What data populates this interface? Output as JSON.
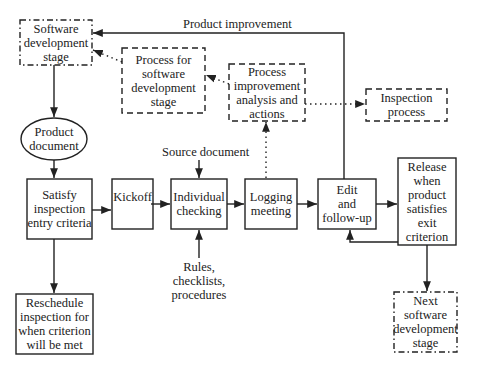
{
  "diagram": {
    "colors": {
      "line": "#222222",
      "background": "#ffffff"
    },
    "nodes": {
      "software_dev_stage": {
        "lines": [
          "Software",
          "development",
          "stage"
        ],
        "border": "dash-dot"
      },
      "process_for_sw_dev": {
        "lines": [
          "Process for",
          "software",
          "development",
          "stage"
        ],
        "border": "dashed"
      },
      "process_improvement": {
        "lines": [
          "Process",
          "improvement",
          "analysis and",
          "actions"
        ],
        "border": "dashed"
      },
      "inspection_process": {
        "lines": [
          "Inspection",
          "process"
        ],
        "border": "dashed"
      },
      "product_document": {
        "lines": [
          "Product",
          "document"
        ],
        "shape": "ellipse"
      },
      "satisfy_entry": {
        "lines": [
          "Satisfy",
          "inspection",
          "entry criteria"
        ],
        "border": "solid"
      },
      "kickoff": {
        "lines": [
          "Kickoff"
        ],
        "border": "solid"
      },
      "individual_checking": {
        "lines": [
          "Individual",
          "checking"
        ],
        "border": "solid"
      },
      "logging_meeting": {
        "lines": [
          "Logging",
          "meeting"
        ],
        "border": "solid"
      },
      "edit_followup": {
        "lines": [
          "Edit",
          "and",
          "follow-up"
        ],
        "border": "solid"
      },
      "release": {
        "lines": [
          "Release",
          "when",
          "product",
          "satisfies",
          "exit",
          "criterion"
        ],
        "border": "solid"
      },
      "reschedule": {
        "lines": [
          "Reschedule",
          "inspection for",
          "when criterion",
          "will be met"
        ],
        "border": "solid"
      },
      "next_sw_dev_stage": {
        "lines": [
          "Next",
          "software",
          "development",
          "stage"
        ],
        "border": "dash-dot"
      }
    },
    "labels": {
      "product_improvement": "Product improvement",
      "source_document": "Source document",
      "rules": [
        "Rules,",
        "checklists,",
        "procedures"
      ]
    },
    "edges": [
      {
        "from": "software_dev_stage",
        "to": "product_document",
        "style": "solid"
      },
      {
        "from": "product_document",
        "to": "satisfy_entry",
        "style": "solid"
      },
      {
        "from": "satisfy_entry",
        "to": "kickoff",
        "style": "solid"
      },
      {
        "from": "satisfy_entry",
        "to": "reschedule",
        "style": "solid"
      },
      {
        "from": "kickoff",
        "to": "individual_checking",
        "style": "solid"
      },
      {
        "from": "individual_checking",
        "to": "logging_meeting",
        "style": "solid"
      },
      {
        "from": "logging_meeting",
        "to": "edit_followup",
        "style": "solid"
      },
      {
        "from": "edit_followup",
        "to": "release",
        "style": "solid"
      },
      {
        "from": "release",
        "to": "edit_followup",
        "style": "solid"
      },
      {
        "from": "release",
        "to": "next_sw_dev_stage",
        "style": "solid"
      },
      {
        "from": "edit_followup",
        "to": "software_dev_stage",
        "style": "solid",
        "label": "Product improvement"
      },
      {
        "from": "source_document",
        "to": "individual_checking",
        "style": "solid"
      },
      {
        "from": "rules",
        "to": "individual_checking",
        "style": "solid"
      },
      {
        "from": "logging_meeting",
        "to": "process_improvement",
        "style": "dotted"
      },
      {
        "from": "process_improvement",
        "to": "process_for_sw_dev",
        "style": "dotted"
      },
      {
        "from": "process_improvement",
        "to": "inspection_process",
        "style": "dotted"
      },
      {
        "from": "process_for_sw_dev",
        "to": "software_dev_stage",
        "style": "dotted"
      }
    ]
  }
}
